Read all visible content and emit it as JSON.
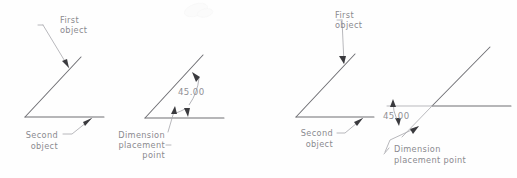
{
  "figure": {
    "canvas": {
      "width": 517,
      "height": 178,
      "background": "#fefefe"
    },
    "colors": {
      "object_line": "#6e6e73",
      "extension_line": "#a8a8ae",
      "leader_line": "#a6a6ab",
      "label_text": "#8a8a8f",
      "arrow_fill": "#3a3a3e"
    }
  },
  "panels": [
    {
      "id": "panel-1",
      "name": "select-objects-interior",
      "labels": {
        "first_object_line1": "First",
        "first_object_line2": "object",
        "second_object_line1": "Second",
        "second_object_line2": "object"
      }
    },
    {
      "id": "panel-2",
      "name": "interior-angle-dimension",
      "labels": {
        "dimension_value": "45.00",
        "placement_line1": "Dimension",
        "placement_line2": "placement",
        "placement_line3": "point"
      }
    },
    {
      "id": "panel-3",
      "name": "select-objects-exterior",
      "labels": {
        "first_object_line1": "First",
        "first_object_line2": "object",
        "second_object_line1": "Second",
        "second_object_line2": "object"
      }
    },
    {
      "id": "panel-4",
      "name": "exterior-angle-dimension",
      "labels": {
        "dimension_value": "45.00",
        "placement_line1": "Dimension",
        "placement_line2": "placement  point"
      }
    }
  ]
}
